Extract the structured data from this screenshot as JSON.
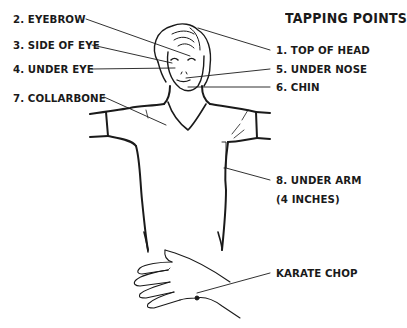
{
  "title": "TAPPING POINTS",
  "labels": {
    "top_of_head": "1. TOP OF HEAD",
    "eyebrow": "2. EYEBROW",
    "side_of_eye": "3. SIDE OF EYE",
    "under_eye": "4. UNDER EYE",
    "under_nose": "5. UNDER NOSE",
    "chin": "6. CHIN",
    "collarbone": "7. COLLARBONE",
    "under_arm": "8. UNDER ARM",
    "under_arm_note": "(4 INCHES)",
    "karate_chop": "KARATE CHOP"
  },
  "colors": {
    "line": "#1a1a1a",
    "background": "#ffffff"
  }
}
